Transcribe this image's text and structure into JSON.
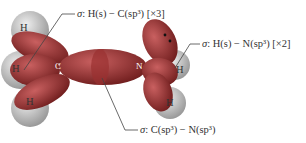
{
  "diagram": {
    "molecule": "CH3NH2",
    "atoms": {
      "carbon": "C",
      "nitrogen": "N",
      "hydrogens_on_carbon": [
        "H",
        "H",
        "H"
      ],
      "hydrogens_on_nitrogen": [
        "H",
        "H"
      ]
    },
    "labels": {
      "ch_bond": {
        "sigma": "σ",
        "text": ": H(s) − C(sp³) [×3]"
      },
      "nh_bond": {
        "sigma": "σ",
        "text": ": H(s) − N(sp³) [×2]"
      },
      "cn_bond": {
        "sigma": "σ",
        "text": ": C(sp³) − N(sp³)"
      }
    },
    "colors": {
      "orbital": "#a83a3a",
      "orbital_dark": "#7a2020",
      "hydrogen_sphere": "#c8c8c8",
      "leader_line": "#444444"
    }
  }
}
